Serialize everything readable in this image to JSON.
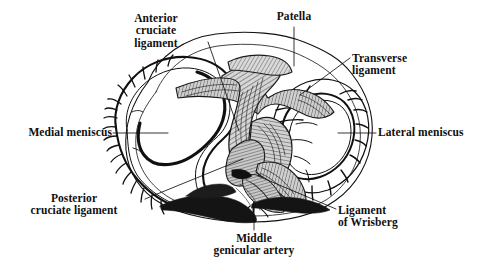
{
  "figure": {
    "background_color": "#ffffff",
    "ink_color": "#101010",
    "shading_color": "#8f8f8f",
    "width": 489,
    "height": 276
  },
  "labels": [
    {
      "id": "anterior-cruciate-ligament",
      "text": "Anterior\ncruciate\nligament",
      "lines": [
        "Anterior",
        "cruciate",
        "ligament"
      ],
      "align": "center",
      "x": 104,
      "y": 12,
      "leader": {
        "from": [
          208,
          42
        ],
        "to": [
          239,
          131
        ]
      }
    },
    {
      "id": "patella",
      "text": "Patella",
      "lines": [
        "Patella"
      ],
      "align": "center",
      "x": 248,
      "y": 10,
      "leader": {
        "from": [
          294,
          27
        ],
        "to": [
          294,
          66
        ]
      }
    },
    {
      "id": "transverse-ligament",
      "text": "Transverse\nligament",
      "lines": [
        "Transverse",
        "ligament"
      ],
      "align": "left",
      "x": 352,
      "y": 52,
      "leader": {
        "from": [
          350,
          58
        ],
        "to": [
          300,
          95
        ]
      }
    },
    {
      "id": "medial-meniscus",
      "text": "Medial meniscus",
      "lines": [
        "Medial meniscus"
      ],
      "align": "right",
      "x": 4,
      "y": 126,
      "leader": {
        "from": [
          113,
          133
        ],
        "to": [
          168,
          133
        ]
      }
    },
    {
      "id": "lateral-meniscus",
      "text": "Lateral meniscus",
      "lines": [
        "Lateral meniscus"
      ],
      "align": "left",
      "x": 378,
      "y": 126,
      "leader": {
        "from": [
          376,
          133
        ],
        "to": [
          338,
          133
        ]
      }
    },
    {
      "id": "posterior-cruciate-ligament",
      "text": "Posterior\ncruciate ligament",
      "lines": [
        "Posterior",
        "cruciate ligament"
      ],
      "align": "center",
      "x": 8,
      "y": 192,
      "leader": {
        "from": [
          145,
          199
        ],
        "to": [
          243,
          159
        ]
      }
    },
    {
      "id": "ligament-of-wrisberg",
      "text": "Ligament\nof Wrisberg",
      "lines": [
        "Ligament",
        "of Wrisberg"
      ],
      "align": "left",
      "x": 338,
      "y": 204,
      "leader": {
        "from": [
          336,
          209
        ],
        "to": [
          258,
          176
        ]
      }
    },
    {
      "id": "middle-genicular-artery",
      "text": "Middle\ngenicular artery",
      "lines": [
        "Middle",
        "genicular artery"
      ],
      "align": "center",
      "x": 180,
      "y": 232,
      "leader": {
        "from": [
          254,
          230
        ],
        "to": [
          254,
          202
        ]
      }
    }
  ],
  "structures": [
    {
      "id": "joint-capsule-outline",
      "name": "joint capsule outline"
    },
    {
      "id": "medial-meniscus-ring",
      "name": "medial meniscus (C-shaped ring, left)"
    },
    {
      "id": "lateral-meniscus-ring",
      "name": "lateral meniscus (O-shaped ring, right)"
    },
    {
      "id": "anterior-cruciate-band",
      "name": "anterior cruciate ligament band"
    },
    {
      "id": "posterior-cruciate-band",
      "name": "posterior cruciate ligament band"
    },
    {
      "id": "transverse-ligament-band",
      "name": "transverse ligament band"
    },
    {
      "id": "wrisberg-band",
      "name": "ligament of Wrisberg"
    },
    {
      "id": "middle-genicular-artery-vessel",
      "name": "middle genicular artery"
    },
    {
      "id": "peripheral-vessels",
      "name": "peripheral meniscal vessels"
    }
  ]
}
